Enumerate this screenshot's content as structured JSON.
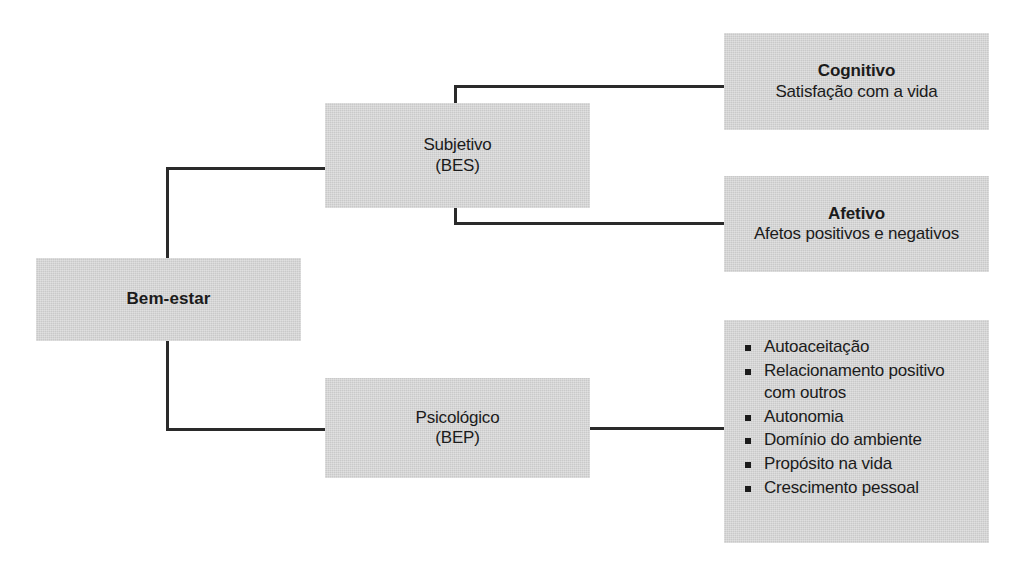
{
  "diagram": {
    "title": "Bem-estar",
    "root": {
      "label": "Bem-estar"
    },
    "branches": [
      {
        "id": "subjective",
        "line1": "Subjetivo",
        "line2": "(BES)",
        "children": [
          {
            "id": "cognitive",
            "heading": "Cognitivo",
            "description": "Satisfação com a vida"
          },
          {
            "id": "affective",
            "heading": "Afetivo",
            "description": "Afetos positivos e negativos"
          }
        ]
      },
      {
        "id": "psychological",
        "line1": "Psicológico",
        "line2": "(BEP)",
        "children": [
          {
            "id": "dimensions",
            "items": [
              "Autoaceitação",
              "Relacionamento positivo com outros",
              "Autonomia",
              "Domínio do ambiente",
              "Propósito na vida",
              "Crescimento pessoal"
            ]
          }
        ]
      }
    ],
    "colors": {
      "box_fill": "#c9c9c9",
      "text": "#1b1b1b",
      "connector": "#2a2a2a",
      "background": "#ffffff"
    }
  }
}
